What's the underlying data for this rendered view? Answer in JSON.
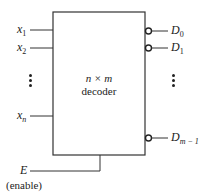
{
  "diagram": {
    "block": {
      "title_line1": "n × m",
      "title_line2": "decoder"
    },
    "inputs": [
      {
        "name": "x",
        "subscript": "1"
      },
      {
        "name": "x",
        "subscript": "2"
      },
      {
        "name": "x",
        "subscript": "n"
      }
    ],
    "outputs": [
      {
        "name": "D",
        "subscript": "0",
        "inverted": true
      },
      {
        "name": "D",
        "subscript": "1",
        "inverted": true
      },
      {
        "name": "D",
        "subscript": "m − 1",
        "inverted": true
      }
    ],
    "enable": {
      "name": "E",
      "caption": "(enable)"
    },
    "ellipsis_input": "⋮",
    "ellipsis_output": "⋮",
    "colors": {
      "line": "#333333",
      "text": "#222222",
      "background": "#ffffff"
    }
  }
}
